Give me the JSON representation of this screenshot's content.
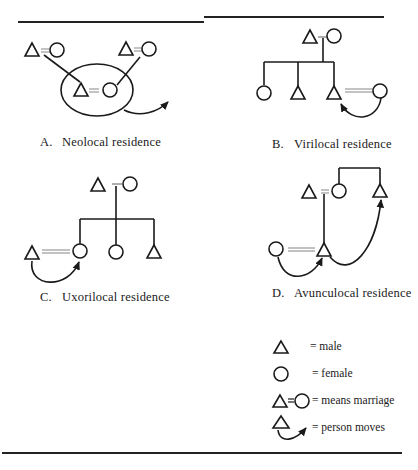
{
  "figure": {
    "panels": [
      {
        "id": "A",
        "letter": "A.",
        "caption": "Neolocal residence"
      },
      {
        "id": "B",
        "letter": "B.",
        "caption": "Virilocal residence"
      },
      {
        "id": "C",
        "letter": "C.",
        "caption": "Uxorilocal residence"
      },
      {
        "id": "D",
        "letter": "D.",
        "caption": "Avunculocal residence"
      }
    ],
    "legend": [
      {
        "symbol": "triangle-icon",
        "text": "= male"
      },
      {
        "symbol": "circle-icon",
        "text": "= female"
      },
      {
        "symbol": "marriage-icon",
        "text": "= means marriage"
      },
      {
        "symbol": "person-moves-icon",
        "text": "= person moves"
      }
    ],
    "colors": {
      "ink": "#1a1a1a",
      "marriage_line": "#9a9a9a",
      "background": "#ffffff"
    }
  }
}
